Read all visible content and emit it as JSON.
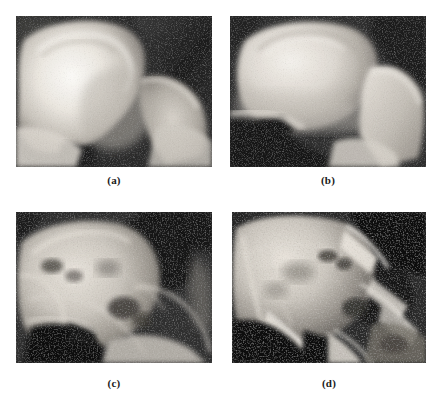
{
  "figure": {
    "background_color": "#ffffff",
    "caption_color": "#1a1a1a",
    "layout": "2x2-grid",
    "modality": "radiograph",
    "anatomy": "hip-pelvis",
    "colorspace": "grayscale"
  },
  "panels": [
    {
      "id": "a",
      "caption": "(a)",
      "name": "radiograph-panel-a",
      "description": "Grayscale hip radiograph: bright femoral head and acetabulum at left, dark soft-tissue region upper right",
      "tone": {
        "background": "#242424",
        "bone_bright": "#f2f0ec",
        "bone_mid": "#bdb9b2",
        "bone_dark": "#6e6a64",
        "void": "#181818"
      }
    },
    {
      "id": "b",
      "caption": "(b)",
      "name": "radiograph-panel-b",
      "description": "Grayscale hip radiograph: large bright ilium/femoral head mass, dark notch upper right, dark void lower left",
      "tone": {
        "background": "#2a2a2a",
        "bone_bright": "#eeae4",
        "bone_mid": "#b5b0a9",
        "bone_dark": "#6a655f",
        "void": "#141414"
      }
    },
    {
      "id": "c",
      "caption": "(c)",
      "name": "radiograph-panel-c",
      "description": "Grayscale hip radiograph: coarser trabecular texture, dark acetabular fossa upper right, dark obturator foramen lower centre",
      "tone": {
        "background": "#2e2e2e",
        "bone_bright": "#e2ddd6",
        "bone_mid": "#a8a39c",
        "bone_dark": "#5e5a55",
        "void": "#121212"
      }
    },
    {
      "id": "d",
      "caption": "(d)",
      "name": "radiograph-panel-d",
      "description": "Grayscale hip radiograph: highly degraded bone with sharp bright trabecular struts over dark lytic regions",
      "tone": {
        "background": "#303030",
        "bone_bright": "#e6e1d9",
        "bone_mid": "#9d9892",
        "bone_dark": "#56524d",
        "void": "#101010"
      }
    }
  ]
}
